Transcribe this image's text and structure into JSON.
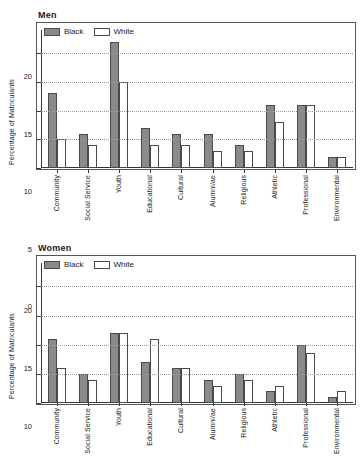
{
  "figure": {
    "panels": [
      {
        "title": "Men",
        "ylabel": "Percentage of Matriculants",
        "legend": [
          {
            "label": "Black",
            "key": "black"
          },
          {
            "label": "White",
            "key": "white"
          }
        ]
      },
      {
        "title": "Women",
        "ylabel": "Percentage of Matriculants",
        "legend": [
          {
            "label": "Black",
            "key": "black"
          },
          {
            "label": "White",
            "key": "white"
          }
        ]
      }
    ]
  },
  "colors": {
    "black_series": "#8a8a8a",
    "white_series": "#ffffff",
    "bar_edge": "#4a4a4a",
    "axis": "#333333",
    "grid": "#999999"
  },
  "chart_data": [
    {
      "type": "bar",
      "title": "Men",
      "xlabel": "",
      "ylabel": "Percentage of Matriculants",
      "ylim": [
        0,
        24
      ],
      "yticks": [
        0,
        5,
        10,
        15,
        20
      ],
      "ytick_labels": [
        "0",
        "5",
        "10",
        "15",
        "20"
      ],
      "grid": true,
      "legend_position": "top-left",
      "categories": [
        "Community",
        "Social Service",
        "Youth",
        "Educational",
        "Cultural",
        "Alumni/ae",
        "Religious",
        "Athletic",
        "Professional",
        "Environmental"
      ],
      "series": [
        {
          "name": "Black",
          "values": [
            13,
            6,
            22,
            7,
            6,
            6,
            4,
            11,
            11,
            2
          ]
        },
        {
          "name": "White",
          "values": [
            5,
            4,
            15,
            4,
            4,
            3,
            3,
            8,
            11,
            2
          ]
        }
      ]
    },
    {
      "type": "bar",
      "title": "Women",
      "xlabel": "",
      "ylabel": "Percentage of Matriculants",
      "ylim": [
        0,
        24
      ],
      "yticks": [
        0,
        5,
        10,
        15,
        20
      ],
      "ytick_labels": [
        "0",
        "5",
        "10",
        "15",
        "20"
      ],
      "grid": true,
      "legend_position": "top-left",
      "categories": [
        "Community",
        "Social Service",
        "Youth",
        "Educational",
        "Cultural",
        "Alumni/ae",
        "Religious",
        "Athletic",
        "Professional",
        "Environmental"
      ],
      "series": [
        {
          "name": "Black",
          "values": [
            11,
            5,
            12,
            7,
            6,
            4,
            5,
            2,
            10,
            1
          ]
        },
        {
          "name": "White",
          "values": [
            6,
            4,
            12,
            11,
            6,
            3,
            4,
            3,
            8.5,
            2
          ]
        }
      ]
    }
  ]
}
